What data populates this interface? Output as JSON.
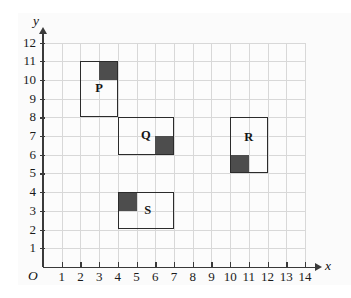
{
  "figure": {
    "type": "coordinate-grid",
    "x_axis": {
      "name": "x",
      "min": 0,
      "max": 14,
      "ticks": [
        1,
        2,
        3,
        4,
        5,
        6,
        7,
        8,
        9,
        10,
        11,
        12,
        13,
        14
      ],
      "tick_labels": [
        "1",
        "2",
        "3",
        "4",
        "5",
        "6",
        "7",
        "8",
        "9",
        "10",
        "11",
        "12",
        "13",
        "14"
      ]
    },
    "y_axis": {
      "name": "y",
      "min": 0,
      "max": 12,
      "ticks": [
        1,
        2,
        3,
        4,
        5,
        6,
        7,
        8,
        9,
        10,
        11,
        12
      ],
      "tick_labels": [
        "1",
        "2",
        "3",
        "4",
        "5",
        "6",
        "7",
        "8",
        "9",
        "10",
        "11",
        "12"
      ]
    },
    "origin_label": "O",
    "grid": {
      "visible": true,
      "spacing": 1,
      "line_color": "#d8d8d8",
      "background_color": "#fcfcfc"
    },
    "colors": {
      "axis": "#3a3a3a",
      "rectangle_outline": "#2b2b2b",
      "shaded_square": "#4d4d4d"
    },
    "rectangles": [
      {
        "label": "P",
        "x0": 2,
        "y0": 8,
        "x1": 4,
        "y1": 11,
        "width": 2,
        "height": 3,
        "label_x": 3,
        "label_y": 9.5,
        "shaded": {
          "x0": 3,
          "y0": 10,
          "x1": 4,
          "y1": 11,
          "position": "top-right"
        }
      },
      {
        "label": "Q",
        "x0": 4,
        "y0": 6,
        "x1": 7,
        "y1": 8,
        "width": 3,
        "height": 2,
        "label_x": 5.5,
        "label_y": 7,
        "shaded": {
          "x0": 6,
          "y0": 6,
          "x1": 7,
          "y1": 7,
          "position": "bottom-right"
        }
      },
      {
        "label": "R",
        "x0": 10,
        "y0": 5,
        "x1": 12,
        "y1": 8,
        "width": 2,
        "height": 3,
        "label_x": 11,
        "label_y": 6.9,
        "shaded": {
          "x0": 10,
          "y0": 5,
          "x1": 11,
          "y1": 6,
          "position": "bottom-left"
        }
      },
      {
        "label": "S",
        "x0": 4,
        "y0": 2,
        "x1": 7,
        "y1": 4,
        "width": 3,
        "height": 2,
        "label_x": 5.6,
        "label_y": 3,
        "shaded": {
          "x0": 4,
          "y0": 3,
          "x1": 5,
          "y1": 4,
          "position": "top-left"
        }
      }
    ]
  }
}
